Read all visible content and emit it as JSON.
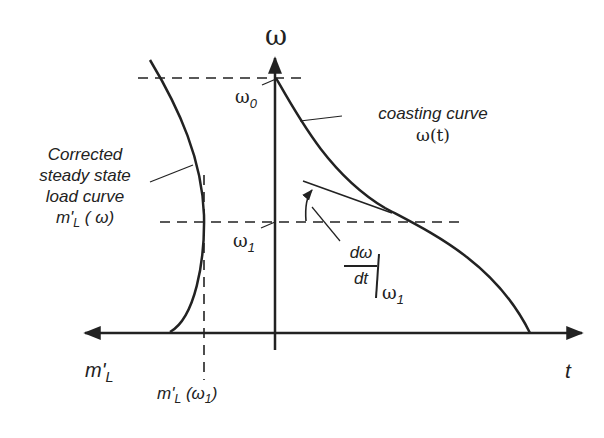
{
  "diagram": {
    "axes": {
      "vertical_label": "ω",
      "horizontal_right_label": "t",
      "horizontal_left_label_main": "m'",
      "horizontal_left_label_sub": "L"
    },
    "levels": {
      "omega0_main": "ω",
      "omega0_sub": "0",
      "omega1_main": "ω",
      "omega1_sub": "1"
    },
    "annotations": {
      "coasting_line1": "coasting curve",
      "coasting_line2": "ω(t)",
      "load_line1": "Corrected",
      "load_line2": "steady state",
      "load_line3": "load curve",
      "load_line4_main": "m'",
      "load_line4_sub": "L",
      "load_line4_arg": " ( ω)",
      "derivative_num": "dω",
      "derivative_den": "dt",
      "derivative_eval_main": "ω",
      "derivative_eval_sub": "1",
      "load_at_omega1_main": "m'",
      "load_at_omega1_sub": "L",
      "load_at_omega1_arg_open": " (ω",
      "load_at_omega1_arg_sub": "1",
      "load_at_omega1_arg_close": ")"
    },
    "colors": {
      "line": "#222222",
      "background": "#ffffff"
    }
  }
}
